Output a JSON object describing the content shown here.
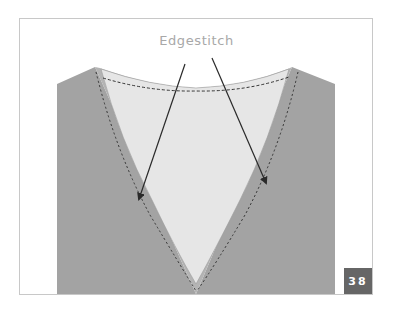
{
  "figure": {
    "callout_label": "Edgestitch",
    "page_badge": "38",
    "colors": {
      "frame_border": "#c8c8c8",
      "garment": "#a3a3a3",
      "band": "#b4b4b4",
      "facing": "#e6e6e6",
      "stitch": "#333333",
      "arrow": "#2a2a2a",
      "label": "#a8a8a8",
      "badge_bg": "#666666",
      "badge_text": "#ffffff"
    }
  }
}
